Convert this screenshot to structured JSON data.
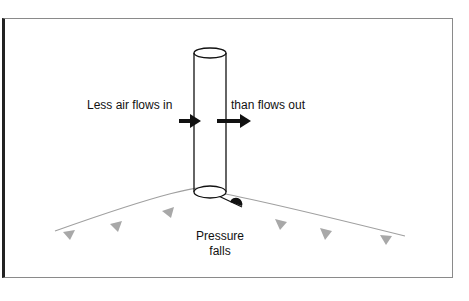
{
  "diagram": {
    "labels": {
      "inflow": "Less air flows in",
      "outflow": "than flows out",
      "pressure_line1": "Pressure",
      "pressure_line2": "falls"
    },
    "colors": {
      "outline": "#111111",
      "front_line": "#a0a0a0",
      "front_triangles": "#a8a8a8",
      "border": "#8a8a8a"
    },
    "icons": [
      "column-cylinder",
      "inflow-arrow",
      "outflow-arrow",
      "warm-front-semicircle",
      "cold-front-triangles"
    ]
  }
}
